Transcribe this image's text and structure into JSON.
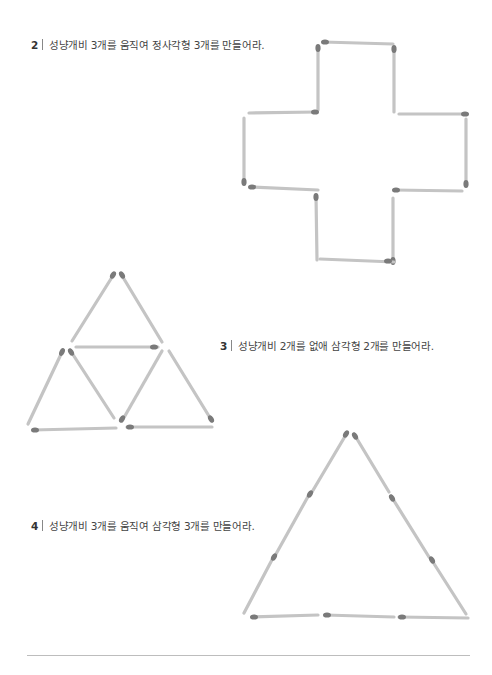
{
  "problems": [
    {
      "number": "2",
      "text": "성냥개비 3개를 움직여 정사각형 3개를 만들어라."
    },
    {
      "number": "3",
      "text": "성냥개비 2개를 없애 삼각형 2개를 만들어라."
    },
    {
      "number": "4",
      "text": "성냥개비 3개를 움직여 삼각형 3개를 만들어라."
    }
  ],
  "colors": {
    "matchstick": "#c4c4c4",
    "match_head": "#7a7a7a",
    "text": "#444444",
    "rule": "#bdbdbd"
  },
  "figures": {
    "cross_matchsticks": 12,
    "triangle_grid_matchsticks": 9,
    "big_triangle_matchsticks": 9
  }
}
